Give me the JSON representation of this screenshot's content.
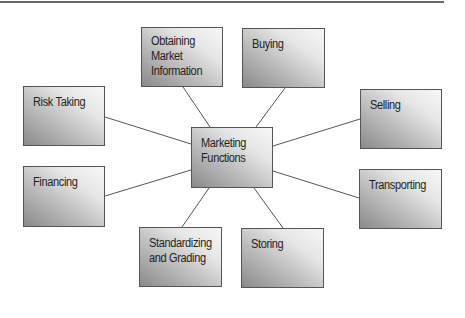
{
  "diagram": {
    "type": "hub-and-spoke",
    "center": {
      "id": "center",
      "label": "Marketing Functions",
      "box": [
        191,
        127,
        82,
        61
      ]
    },
    "nodes": [
      {
        "id": "obtaining",
        "label": "Obtaining\nMarket\nInformation",
        "box": [
          141,
          27,
          82,
          60
        ]
      },
      {
        "id": "buying",
        "label": "Buying",
        "box": [
          242,
          28,
          83,
          60
        ]
      },
      {
        "id": "risk",
        "label": "Risk Taking",
        "box": [
          23,
          86,
          82,
          60
        ]
      },
      {
        "id": "selling",
        "label": "Selling",
        "box": [
          360,
          89,
          82,
          60
        ]
      },
      {
        "id": "financing",
        "label": "Financing",
        "box": [
          23,
          166,
          82,
          61
        ]
      },
      {
        "id": "transporting",
        "label": "Transporting",
        "box": [
          359,
          169,
          83,
          60
        ]
      },
      {
        "id": "standardizing",
        "label": "Standardizing\nand Grading",
        "box": [
          139,
          227,
          83,
          60
        ]
      },
      {
        "id": "storing",
        "label": "Storing",
        "box": [
          241,
          228,
          83,
          60
        ]
      }
    ],
    "edges": [
      {
        "from": "obtaining",
        "to": "center",
        "line": [
          183,
          87,
          210,
          127
        ]
      },
      {
        "from": "buying",
        "to": "center",
        "line": [
          285,
          88,
          256,
          127
        ]
      },
      {
        "from": "risk",
        "to": "center",
        "line": [
          105,
          117,
          191,
          144
        ]
      },
      {
        "from": "financing",
        "to": "center",
        "line": [
          105,
          196,
          191,
          170
        ]
      },
      {
        "from": "center",
        "to": "selling",
        "line": [
          273,
          146,
          360,
          119
        ]
      },
      {
        "from": "center",
        "to": "transporting",
        "line": [
          273,
          171,
          359,
          198
        ]
      },
      {
        "from": "center",
        "to": "standardizing",
        "line": [
          209,
          188,
          182,
          227
        ]
      },
      {
        "from": "center",
        "to": "storing",
        "line": [
          254,
          188,
          283,
          228
        ]
      }
    ],
    "colors": {
      "line": "#555555",
      "border": "#555555",
      "text": "#1e1e1e",
      "rule": "#6a6a6a"
    }
  }
}
